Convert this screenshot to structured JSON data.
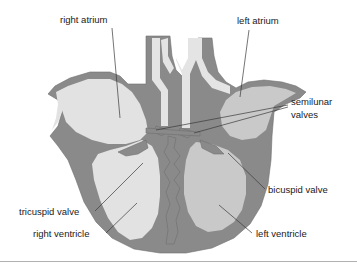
{
  "figure": {
    "background_color": "#ffffff"
  },
  "colors": {
    "muscle_wall": "#8a8a8a",
    "muscle_outline": "#6f6f6f",
    "chamber_light": "#e2e2e2",
    "chamber_mid": "#c9c9c9",
    "vessel_light": "#e4e4e4",
    "leader_line": "#3a3a3a",
    "text": "#1a1a1a",
    "baseline_rule": "#b0b0b0"
  },
  "labels": {
    "right_atrium": "right atrium",
    "left_atrium": "left atrium",
    "semilunar_valves_line1": "semilunar",
    "semilunar_valves_line2": "valves",
    "bicuspid_valve": "bicuspid valve",
    "tricuspid_valve": "tricuspid valve",
    "right_ventricle": "right ventricle",
    "left_ventricle": "left ventricle"
  },
  "label_positions": {
    "right_atrium": {
      "x": 60,
      "y": 23
    },
    "left_atrium": {
      "x": 237,
      "y": 24
    },
    "semilunar_valves_line1": {
      "x": 291,
      "y": 105
    },
    "semilunar_valves_line2": {
      "x": 291,
      "y": 118
    },
    "bicuspid_valve": {
      "x": 268,
      "y": 193
    },
    "tricuspid_valve": {
      "x": 19,
      "y": 215
    },
    "right_ventricle": {
      "x": 33,
      "y": 237
    },
    "left_ventricle": {
      "x": 256,
      "y": 237
    }
  }
}
